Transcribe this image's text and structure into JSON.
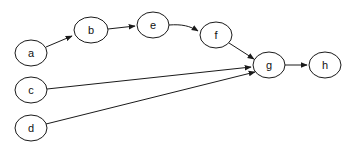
{
  "diagram": {
    "type": "directed-graph",
    "nodes": [
      {
        "id": "a",
        "label": "a",
        "cx": 31,
        "cy": 53,
        "rx": 16,
        "ry": 13
      },
      {
        "id": "b",
        "label": "b",
        "cx": 91,
        "cy": 30,
        "rx": 17,
        "ry": 13
      },
      {
        "id": "e",
        "label": "e",
        "cx": 153,
        "cy": 25,
        "rx": 16,
        "ry": 13
      },
      {
        "id": "f",
        "label": "f",
        "cx": 216,
        "cy": 35,
        "rx": 16,
        "ry": 13
      },
      {
        "id": "g",
        "label": "g",
        "cx": 269,
        "cy": 65,
        "rx": 16,
        "ry": 13
      },
      {
        "id": "h",
        "label": "h",
        "cx": 325,
        "cy": 65,
        "rx": 16,
        "ry": 13
      },
      {
        "id": "c",
        "label": "c",
        "cx": 31,
        "cy": 90,
        "rx": 16,
        "ry": 13
      },
      {
        "id": "d",
        "label": "d",
        "cx": 31,
        "cy": 128,
        "rx": 16,
        "ry": 13
      }
    ],
    "edges": [
      {
        "from": "a",
        "to": "b",
        "d": "M46,47 L72,36"
      },
      {
        "from": "b",
        "to": "e",
        "d": "M108,29 L135,26"
      },
      {
        "from": "e",
        "to": "f",
        "d": "M169,25 C182,24 190,26 198,31"
      },
      {
        "from": "f",
        "to": "g",
        "d": "M229,43 L254,59"
      },
      {
        "from": "c",
        "to": "g",
        "d": "M47,89 L251,67"
      },
      {
        "from": "d",
        "to": "g",
        "d": "M46,124 L255,72"
      },
      {
        "from": "g",
        "to": "h",
        "d": "M285,65 L307,65"
      }
    ],
    "colors": {
      "stroke": "#1a1a1a",
      "fill": "#ffffff",
      "text": "#111111"
    }
  }
}
